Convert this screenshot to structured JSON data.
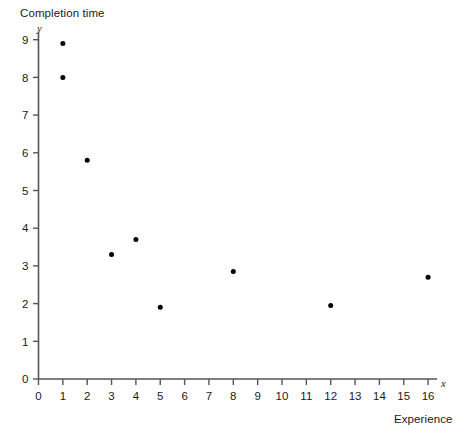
{
  "chart_data": {
    "type": "scatter",
    "title": "Completion time",
    "xlabel": "Experience",
    "ylabel": "Completion time",
    "x_symbol": "x",
    "y_symbol": "y",
    "xlim": [
      0,
      16
    ],
    "ylim": [
      0,
      9
    ],
    "grid": false,
    "legend": null,
    "x_ticks": [
      0,
      1,
      2,
      3,
      4,
      5,
      6,
      7,
      8,
      9,
      10,
      11,
      12,
      13,
      14,
      15,
      16
    ],
    "y_ticks": [
      0,
      1,
      2,
      3,
      4,
      5,
      6,
      7,
      8,
      9
    ],
    "x_tick_labels": [
      "0",
      "1",
      "2",
      "3",
      "4",
      "5",
      "6",
      "7",
      "8",
      "9",
      "10",
      "11",
      "12",
      "13",
      "14",
      "15",
      "16"
    ],
    "y_tick_labels": [
      "0",
      "1",
      "2",
      "3",
      "4",
      "5",
      "6",
      "7",
      "8",
      "9"
    ],
    "points": [
      {
        "x": 1,
        "y": 8.9
      },
      {
        "x": 1,
        "y": 8.0
      },
      {
        "x": 2,
        "y": 5.8
      },
      {
        "x": 3,
        "y": 3.3
      },
      {
        "x": 4,
        "y": 3.7
      },
      {
        "x": 5,
        "y": 1.9
      },
      {
        "x": 8,
        "y": 2.85
      },
      {
        "x": 12,
        "y": 1.95
      },
      {
        "x": 16,
        "y": 2.7
      }
    ],
    "marker_color": "#000000",
    "axis_color": "#555555"
  }
}
